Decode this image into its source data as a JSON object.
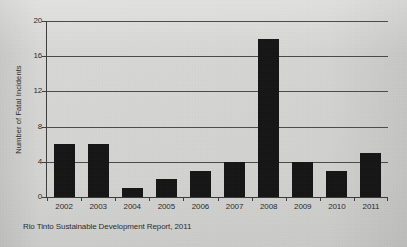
{
  "chart_data": {
    "type": "bar",
    "title": "",
    "subtitle": "",
    "xlabel": "",
    "ylabel": "Number of Fatal Incidents",
    "categories": [
      "2002",
      "2003",
      "2004",
      "2005",
      "2006",
      "2007",
      "2008",
      "2009",
      "2010",
      "2011"
    ],
    "values": [
      6,
      6,
      1,
      2,
      3,
      4,
      18,
      4,
      3,
      5
    ],
    "series": [
      {
        "name": "Fatal incidents",
        "values": [
          6,
          6,
          1,
          2,
          3,
          4,
          18,
          4,
          3,
          5
        ]
      }
    ],
    "ylim": [
      0,
      20
    ],
    "yticks": [
      0,
      4,
      8,
      12,
      16,
      20
    ],
    "ytick_labels": [
      "0",
      "4",
      "8",
      "12",
      "16",
      "20"
    ],
    "grid": true,
    "grid_axis": "y",
    "legend": false,
    "legend_position": "none",
    "bar_color": "#151515",
    "grid_color": "#4a4a4a",
    "background_color": "#d2d2d0",
    "annotations": []
  },
  "caption": {
    "source": "Rio Tinto Sustainable Development Report, 2011"
  }
}
